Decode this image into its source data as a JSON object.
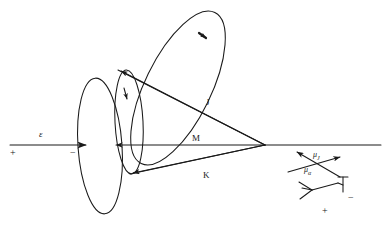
{
  "figure": {
    "background_color": "#ffffff",
    "stroke_color": "#1a1a1a",
    "width": 387,
    "height": 227
  },
  "field_axis": {
    "arrow_label": "ε",
    "plus_sign": "+",
    "minus_sign": "−",
    "arrow_start_x": 10,
    "arrow_end_x": 88,
    "arrow_y": 145,
    "baseline_start_x": 113,
    "baseline_end_x": 381
  },
  "vectors": [
    {
      "name": "J",
      "label": "J",
      "label_x": 206,
      "label_y": 98,
      "from_x": 265,
      "from_y": 145,
      "to_x": 118,
      "to_y": 70
    },
    {
      "name": "M",
      "label": "M",
      "label_x": 192,
      "label_y": 134,
      "from_x": 265,
      "from_y": 145,
      "to_x": 113,
      "to_y": 145
    },
    {
      "name": "K",
      "label": "K",
      "label_x": 203,
      "label_y": 171,
      "from_x": 265,
      "from_y": 145,
      "to_x": 130,
      "to_y": 174
    }
  ],
  "moments": {
    "mu_j": {
      "label": "μ",
      "subscript": "J",
      "label_x": 313,
      "label_y": 151
    },
    "mu_a": {
      "label": "μ",
      "subscript": "α",
      "label_x": 304,
      "label_y": 166
    },
    "dipole_plus": "+",
    "dipole_minus": "−",
    "dipole_plus_x": 322,
    "dipole_plus_y": 206,
    "dipole_minus_x": 348,
    "dipole_minus_y": 196
  },
  "cones": {
    "outer_base_ellipse": {
      "cx": 100,
      "cy": 146,
      "rx": 22,
      "ry": 68,
      "rotate": -4
    },
    "inner_base_ellipse": {
      "cx": 129,
      "cy": 122,
      "rx": 14,
      "ry": 52,
      "rotate": -3
    },
    "j_precession_ellipse": {
      "cx": 178,
      "cy": 88,
      "rx": 33,
      "ry": 84,
      "rotate": 26
    }
  }
}
